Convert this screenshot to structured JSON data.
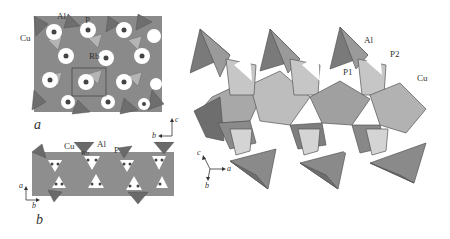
{
  "figure": {
    "panels": [
      {
        "id": "a",
        "label": "a",
        "atom_labels": [
          "Al",
          "P",
          "Cu",
          "Rb"
        ],
        "axes": {
          "horizontal": "b",
          "vertical": "c"
        }
      },
      {
        "id": "b",
        "label": "b",
        "atom_labels": [
          "Cu",
          "Rb",
          "Al",
          "P"
        ],
        "axes": {
          "horizontal": "b",
          "vertical": "a"
        }
      },
      {
        "id": "c",
        "label": "",
        "atom_labels": [
          "Al",
          "P2",
          "P1",
          "Cu"
        ],
        "axes": {
          "vertical": "c",
          "horizontal": "a",
          "depth": "b"
        }
      }
    ],
    "colors": {
      "dark_polyhedra": "#6e6e6e",
      "mid_polyhedra": "#9a9a9a",
      "light_polyhedra": "#c8c8c8",
      "edge": "#555555",
      "background": "#ffffff"
    }
  },
  "panel_a": {
    "label": "a",
    "al": "Al",
    "p": "P",
    "cu": "Cu",
    "rb": "Rb",
    "ax_h": "b",
    "ax_v": "c"
  },
  "panel_b": {
    "label": "b",
    "cu": "Cu",
    "rb": "Rb",
    "al": "Al",
    "p": "P",
    "ax_h": "b",
    "ax_v": "a"
  },
  "panel_c": {
    "al": "Al",
    "p2": "P2",
    "p1": "P1",
    "cu": "Cu",
    "ax_c": "c",
    "ax_a": "a",
    "ax_b": "b"
  }
}
